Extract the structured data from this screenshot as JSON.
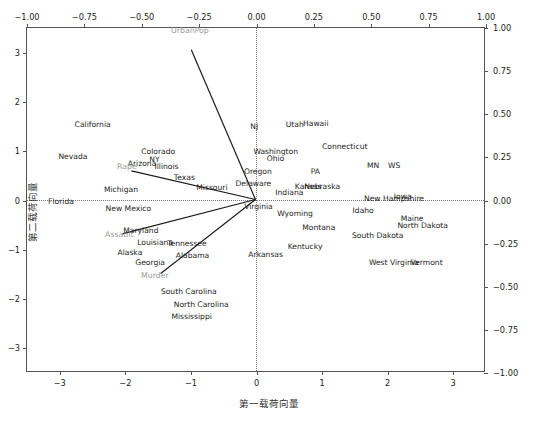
{
  "chart_data": {
    "type": "scatter",
    "title": "",
    "xlabel": "第一载荷向量",
    "ylabel": "第二载荷向量",
    "grid": false,
    "legend": "none",
    "axes": {
      "bottom": {
        "label": "第一载荷向量",
        "lim": [
          -3.5,
          3.5
        ],
        "ticks": [
          -3,
          -2,
          -1,
          0,
          1,
          2,
          3
        ],
        "ticklabels": [
          "-3",
          "-2",
          "-1",
          "0",
          "1",
          "2",
          "3"
        ]
      },
      "left": {
        "label": "第二载荷向量",
        "lim": [
          -3.5,
          3.5
        ],
        "ticks": [
          -3,
          -2,
          -1,
          0,
          1,
          2,
          3
        ],
        "ticklabels": [
          "-3",
          "-2",
          "-1",
          "0",
          "1",
          "2",
          "3"
        ]
      },
      "top": {
        "label": "",
        "lim": [
          -1.0,
          1.0
        ],
        "ticks": [
          -1.0,
          -0.75,
          -0.5,
          -0.25,
          0,
          0.25,
          0.5,
          0.75,
          1.0
        ],
        "ticklabels": [
          "-1.00",
          "-0.75",
          "-0.50",
          "-0.25",
          "0.00",
          "0.25",
          "0.50",
          "0.75",
          "1.00"
        ]
      },
      "right": {
        "label": "",
        "lim": [
          -1.0,
          1.0
        ],
        "ticks": [
          -1.0,
          -0.75,
          -0.5,
          -0.25,
          0,
          0.25,
          0.5,
          0.75,
          1.0
        ],
        "ticklabels": [
          "-1.00",
          "-0.75",
          "-0.50",
          "-0.25",
          "0.00",
          "0.25",
          "0.50",
          "0.75",
          "1.00"
        ]
      }
    },
    "zero_lines": {
      "vertical": 0,
      "horizontal": 0,
      "style": "dotted"
    },
    "colors": {
      "point_label": "#1d1d1d",
      "loading_label": "#9a9a9a",
      "arrow": "#1a1a1a",
      "frame": "#555555"
    },
    "points": [
      {
        "label": "Alabama",
        "x": -0.976,
        "y": -1.122
      },
      {
        "label": "Alaska",
        "x": -1.931,
        "y": -1.062
      },
      {
        "label": "Arizona",
        "x": -1.745,
        "y": 0.738
      },
      {
        "label": "Arkansas",
        "x": 0.14,
        "y": -1.106
      },
      {
        "label": "California",
        "x": -2.499,
        "y": 1.527
      },
      {
        "label": "Colorado",
        "x": -1.499,
        "y": 0.978
      },
      {
        "label": "Connecticut",
        "x": 1.345,
        "y": 1.077
      },
      {
        "label": "Delaware",
        "x": -0.047,
        "y": 0.325
      },
      {
        "label": "Florida",
        "x": -2.981,
        "y": -0.039
      },
      {
        "label": "Georgia",
        "x": -1.622,
        "y": -1.266
      },
      {
        "label": "Hawaii",
        "x": 0.904,
        "y": 1.551
      },
      {
        "label": "Idaho",
        "x": 1.627,
        "y": -0.21
      },
      {
        "label": "Illinois",
        "x": -1.372,
        "y": 0.675
      },
      {
        "label": "Indiana",
        "x": 0.501,
        "y": 0.151
      },
      {
        "label": "Iowa",
        "x": 2.23,
        "y": 0.068
      },
      {
        "label": "Kansas",
        "x": 0.789,
        "y": 0.268
      },
      {
        "label": "Kentucky",
        "x": 0.741,
        "y": -0.95
      },
      {
        "label": "Louisiana",
        "x": -1.546,
        "y": -0.869
      },
      {
        "label": "Maine",
        "x": 2.372,
        "y": -0.376
      },
      {
        "label": "Maryland",
        "x": -1.763,
        "y": -0.622
      },
      {
        "label": "Michigan",
        "x": -2.067,
        "y": 0.218
      },
      {
        "label": "Mississippi",
        "x": -0.989,
        "y": -2.37
      },
      {
        "label": "Missouri",
        "x": -0.68,
        "y": 0.262
      },
      {
        "label": "MN",
        "x": 1.778,
        "y": 0.701
      },
      {
        "label": "Montana",
        "x": 0.95,
        "y": -0.55
      },
      {
        "label": "NJ",
        "x": -0.035,
        "y": 1.492
      },
      {
        "label": "Nebraska",
        "x": 1.002,
        "y": 0.272
      },
      {
        "label": "Nevada",
        "x": -2.8,
        "y": 0.875
      },
      {
        "label": "New Hampshire",
        "x": 2.097,
        "y": 0.035
      },
      {
        "label": "New Mexico",
        "x": -1.954,
        "y": -0.175
      },
      {
        "label": "NY",
        "x": -1.556,
        "y": 0.818
      },
      {
        "label": "North Carolina",
        "x": -0.844,
        "y": -2.113
      },
      {
        "label": "North Dakota",
        "x": 2.534,
        "y": -0.514
      },
      {
        "label": "Ohio",
        "x": 0.291,
        "y": 0.841
      },
      {
        "label": "Oregon",
        "x": 0.021,
        "y": 0.575
      },
      {
        "label": "PA",
        "x": 0.897,
        "y": 0.573
      },
      {
        "label": "South Carolina",
        "x": -1.033,
        "y": -1.866
      },
      {
        "label": "South Dakota",
        "x": 1.849,
        "y": -0.713
      },
      {
        "label": "Tennessee",
        "x": -1.061,
        "y": -0.88
      },
      {
        "label": "Texas",
        "x": -1.1,
        "y": 0.45
      },
      {
        "label": "Utah",
        "x": 0.584,
        "y": 1.524
      },
      {
        "label": "Vermont",
        "x": 2.594,
        "y": -1.261
      },
      {
        "label": "Virginia",
        "x": 0.03,
        "y": -0.142
      },
      {
        "label": "Washington",
        "x": 0.293,
        "y": 0.974
      },
      {
        "label": "West Virginia",
        "x": 2.093,
        "y": -1.27
      },
      {
        "label": "WS",
        "x": 2.098,
        "y": 0.695
      },
      {
        "label": "Wyoming",
        "x": 0.587,
        "y": -0.266
      }
    ],
    "loadings": [
      {
        "label": "UrbanPop",
        "x": -0.281,
        "y": 0.873,
        "label_x": -0.29,
        "label_y": 0.98
      },
      {
        "label": "Rape",
        "x": -0.543,
        "y": 0.167,
        "label_x": -0.565,
        "label_y": 0.192
      },
      {
        "label": "Assault",
        "x": -0.583,
        "y": -0.2,
        "label_x": -0.598,
        "label_y": -0.2
      },
      {
        "label": "Murder",
        "x": -0.415,
        "y": -0.432,
        "label_x": -0.443,
        "label_y": -0.437
      }
    ]
  }
}
